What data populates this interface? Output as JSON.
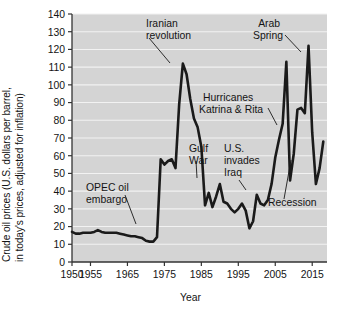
{
  "chart_data": {
    "type": "line",
    "title": "",
    "xlabel": "Year",
    "ylabel": "Crude oil prices (U.S. dollars per barrel, in today's prices, adjusted for inflation)",
    "ylabel_line1": "Crude oil prices (U.S. dollars per barrel,",
    "ylabel_line2": "in today's prices, adjusted for inflation)",
    "xlim": [
      1950,
      2019
    ],
    "ylim": [
      0,
      140
    ],
    "ytick_values": [
      0,
      10,
      20,
      30,
      40,
      50,
      60,
      70,
      80,
      90,
      100,
      110,
      120,
      130,
      140
    ],
    "ytick_labels": [
      "0",
      "10",
      "20",
      "30",
      "40",
      "50",
      "60",
      "70",
      "80",
      "90",
      "100",
      "110",
      "120",
      "130",
      "140"
    ],
    "xtick_values": [
      1950,
      1955,
      1965,
      1975,
      1985,
      1995,
      2005,
      2015
    ],
    "xtick_labels": [
      "1950",
      "1955",
      "1965",
      "1975",
      "1985",
      "1995",
      "2005",
      "2015"
    ],
    "grid": "horizontal",
    "plot_background": "#d4d4d4",
    "grid_color": "#f2f2f2",
    "line_color": "#1a1a1a",
    "series": [
      {
        "name": "Crude oil price (inflation adjusted)",
        "x": [
          1950,
          1951,
          1952,
          1953,
          1954,
          1955,
          1956,
          1957,
          1958,
          1959,
          1960,
          1961,
          1962,
          1963,
          1964,
          1965,
          1966,
          1967,
          1968,
          1969,
          1970,
          1971,
          1972,
          1973,
          1974,
          1975,
          1976,
          1977,
          1978,
          1979,
          1980,
          1981,
          1982,
          1983,
          1984,
          1985,
          1986,
          1987,
          1988,
          1989,
          1990,
          1991,
          1992,
          1993,
          1994,
          1995,
          1996,
          1997,
          1998,
          1999,
          2000,
          2001,
          2002,
          2003,
          2004,
          2005,
          2006,
          2007,
          2008,
          2009,
          2010,
          2011,
          2012,
          2013,
          2014,
          2015,
          2016,
          2017,
          2018
        ],
        "values": [
          17,
          16,
          16,
          16.5,
          16.5,
          16.5,
          17,
          18,
          17,
          16.5,
          16.5,
          16.5,
          16.5,
          16,
          15.5,
          15,
          14.5,
          14.5,
          14,
          13.5,
          12,
          11.5,
          11.5,
          14,
          58,
          55,
          57,
          58,
          53,
          89,
          112,
          106,
          92,
          81,
          76,
          65,
          32,
          39,
          31,
          37,
          44,
          34,
          33,
          30,
          28,
          30,
          33,
          29,
          19,
          23,
          38,
          33,
          32,
          35,
          44,
          59,
          69,
          78,
          113,
          46,
          61,
          86,
          87,
          84,
          122,
          73,
          44,
          53,
          68
        ],
        "annotated_points": [
          {
            "label": "Iranian revolution",
            "year": 1980,
            "value": 112
          },
          {
            "label": "Arab Spring",
            "year": 2013,
            "value": 122
          },
          {
            "label": "Hurricanes Katrina & Rita",
            "year": 2005,
            "value": 59
          },
          {
            "label": "Gulf War",
            "year": 1990,
            "value": 44
          },
          {
            "label": "U.S. invades Iraq",
            "year": 2003,
            "value": 35
          },
          {
            "label": "OPEC oil embargo",
            "year": 1973,
            "value": 14
          },
          {
            "label": "Recession",
            "year": 2009,
            "value": 46
          }
        ]
      }
    ],
    "annotations": [
      {
        "id": "iranian-revolution",
        "line1": "Iranian",
        "line2": "revolution",
        "text": "Iranian revolution"
      },
      {
        "id": "arab-spring",
        "line1": "Arab",
        "line2": "Spring",
        "text": "Arab Spring"
      },
      {
        "id": "hurricanes",
        "line1": "Hurricanes",
        "line2": "Katrina & Rita",
        "text": "Hurricanes Katrina & Rita"
      },
      {
        "id": "gulf-war",
        "line1": "Gulf",
        "line2": "War",
        "text": "Gulf War"
      },
      {
        "id": "us-invades-iraq",
        "line1": "U.S.",
        "line2": "invades",
        "line3": "Iraq",
        "text": "U.S. invades Iraq"
      },
      {
        "id": "opec-embargo",
        "line1": "OPEC oil",
        "line2": "embargo",
        "text": "OPEC oil embargo"
      },
      {
        "id": "recession",
        "line1": "Recession",
        "text": "Recession"
      }
    ]
  }
}
